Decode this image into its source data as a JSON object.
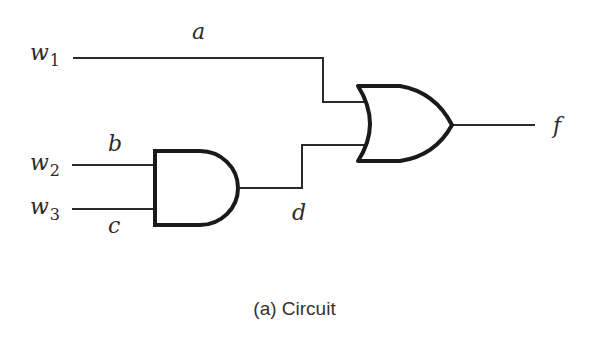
{
  "diagram": {
    "type": "logic-circuit",
    "inputs": [
      {
        "name": "w",
        "sub": "1"
      },
      {
        "name": "w",
        "sub": "2"
      },
      {
        "name": "w",
        "sub": "3"
      }
    ],
    "wires": {
      "a": "a",
      "b": "b",
      "c": "c",
      "d": "d"
    },
    "output": "f",
    "gates": [
      {
        "type": "AND",
        "inputs": [
          "b",
          "c"
        ],
        "output": "d"
      },
      {
        "type": "OR",
        "inputs": [
          "a",
          "d"
        ],
        "output": "f"
      }
    ],
    "caption": "(a) Circuit"
  }
}
